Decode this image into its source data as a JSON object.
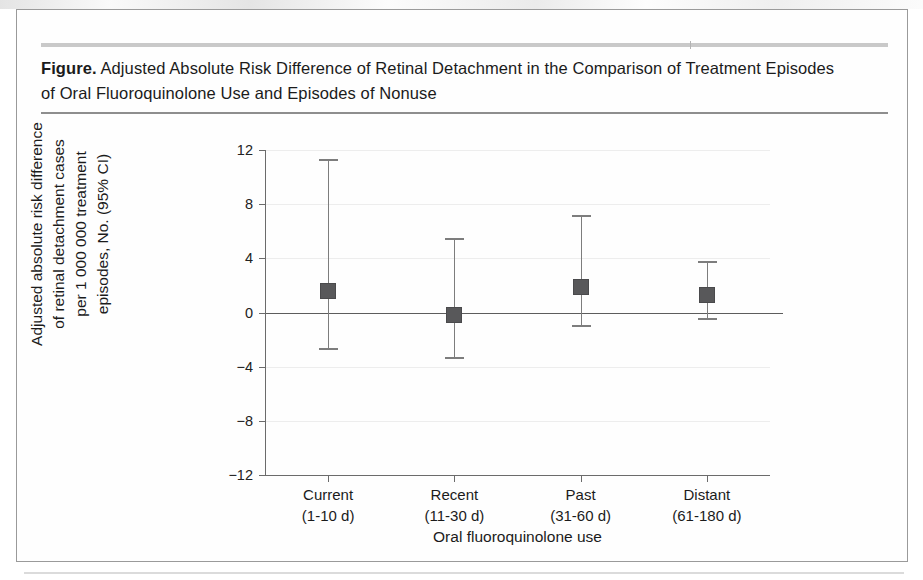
{
  "figure": {
    "caption_lead": "Figure.",
    "caption_text": " Adjusted Absolute Risk Difference of Retinal Detachment in the Comparison of Treatment Episodes of Oral Fluoroquinolone Use and Episodes of Nonuse"
  },
  "chart_data": {
    "type": "scatter",
    "title": "Adjusted Absolute Risk Difference of Retinal Detachment in the Comparison of Treatment Episodes of Oral Fluoroquinolone Use and Episodes of Nonuse",
    "xlabel": "Oral fluoroquinolone use",
    "ylabel": "Adjusted absolute risk difference of retinal detachment cases per 1 000 000 treatment episodes, No. (95% CI)",
    "ylabel_lines": [
      "Adjusted absolute risk difference",
      "of retinal detachment cases",
      "per 1 000 000 treatment",
      "episodes, No. (95% CI)"
    ],
    "ylim": [
      -12,
      12
    ],
    "yticks": [
      12,
      8,
      4,
      0,
      -4,
      -8,
      -12
    ],
    "ytick_labels": [
      "12",
      "8",
      "4",
      "0",
      "−4",
      "−8",
      "−12"
    ],
    "grid": true,
    "legend": "none",
    "reference_line": 0,
    "categories": [
      "Current",
      "Recent",
      "Past",
      "Distant"
    ],
    "category_sublabels": [
      "(1-10 d)",
      "(11-30 d)",
      "(31-60 d)",
      "(61-180 d)"
    ],
    "points": [
      {
        "category": "Current",
        "sublabel": "(1-10 d)",
        "value": 1.6,
        "ci_low": -2.6,
        "ci_high": 11.3
      },
      {
        "category": "Recent",
        "sublabel": "(11-30 d)",
        "value": -0.2,
        "ci_low": -3.3,
        "ci_high": 5.5
      },
      {
        "category": "Past",
        "sublabel": "(31-60 d)",
        "value": 1.9,
        "ci_low": -0.9,
        "ci_high": 7.2
      },
      {
        "category": "Distant",
        "sublabel": "(61-180 d)",
        "value": 1.3,
        "ci_low": -0.4,
        "ci_high": 3.8
      }
    ],
    "marker_color": "#58585a",
    "whisker_color": "#7d7d7d",
    "axis_color": "#6b6b6b",
    "grid_color": "#ededed"
  }
}
